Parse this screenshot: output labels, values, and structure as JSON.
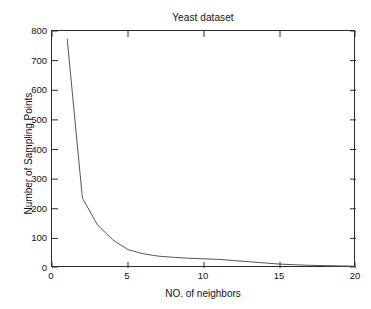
{
  "chart_data": {
    "type": "line",
    "title": "Yeast dataset",
    "xlabel": "NO. of neighbors",
    "ylabel": "Number of Sampling Points",
    "xlim": [
      0,
      20
    ],
    "ylim": [
      0,
      800
    ],
    "xticks": [
      0,
      5,
      10,
      15,
      20
    ],
    "xtick_labels": [
      "0",
      "5",
      "10",
      "15",
      "20"
    ],
    "yticks": [
      0,
      100,
      200,
      300,
      400,
      500,
      600,
      700,
      800
    ],
    "ytick_labels": [
      "0",
      "100",
      "200",
      "300",
      "400",
      "500",
      "600",
      "700",
      "800"
    ],
    "grid": false,
    "legend": null,
    "series": [
      {
        "name": "sampling points",
        "color": "#555555",
        "line_width": 1,
        "x": [
          1,
          2,
          3,
          4,
          5,
          6,
          7,
          8,
          9,
          10,
          11,
          12,
          13,
          14,
          15,
          16,
          17,
          18,
          19,
          20
        ],
        "values": [
          773,
          236,
          145,
          95,
          62,
          48,
          40,
          36,
          33,
          31,
          29,
          25,
          21,
          17,
          13,
          11,
          9,
          8,
          7,
          6
        ]
      }
    ]
  },
  "figure": {
    "background": "#ffffff",
    "axes_color": "#2b2b2b",
    "text_color": "#111111"
  }
}
